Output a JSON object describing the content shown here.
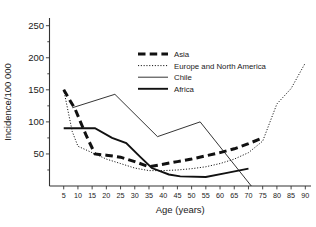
{
  "chart_data": {
    "type": "line",
    "title": "",
    "xlabel": "Age (years)",
    "ylabel": "Incidence/100 000",
    "xlim": [
      0,
      92
    ],
    "ylim": [
      0,
      262
    ],
    "grid": false,
    "legend_position": "upper-center",
    "xticks": [
      5,
      10,
      15,
      20,
      25,
      30,
      35,
      40,
      45,
      50,
      55,
      60,
      65,
      70,
      75,
      80,
      85,
      90
    ],
    "xtick_labels": [
      "5",
      "10",
      "15",
      "20",
      "25",
      "30",
      "35",
      "40",
      "45",
      "50",
      "55",
      "60",
      "65",
      "70",
      "75",
      "80",
      "85",
      "90"
    ],
    "yticks": [
      50,
      100,
      150,
      200,
      250
    ],
    "ytick_labels": [
      "50",
      "100",
      "150",
      "200",
      "250"
    ],
    "yminor": [
      25,
      75,
      125,
      175,
      225
    ],
    "series": [
      {
        "name": "Asia",
        "style": "thick-dashed",
        "color": "#111111",
        "x": [
          5,
          9,
          13,
          16,
          20,
          25,
          30,
          35,
          40,
          45,
          50,
          55,
          60,
          65,
          70,
          75
        ],
        "y": [
          150,
          120,
          78,
          50,
          48,
          45,
          38,
          30,
          34,
          38,
          42,
          47,
          52,
          58,
          66,
          75
        ]
      },
      {
        "name": "Europe and North America",
        "style": "dotted",
        "color": "#444444",
        "x": [
          5,
          8,
          10,
          15,
          20,
          25,
          30,
          35,
          40,
          45,
          50,
          55,
          60,
          65,
          70,
          75,
          80,
          85,
          90
        ],
        "y": [
          150,
          85,
          62,
          52,
          42,
          35,
          28,
          24,
          24,
          25,
          27,
          30,
          35,
          42,
          52,
          70,
          128,
          152,
          192
        ]
      },
      {
        "name": "Chile",
        "style": "thin-solid",
        "color": "#555555",
        "x": [
          8,
          23,
          38,
          53,
          71
        ],
        "y": [
          122,
          143,
          77,
          100,
          0
        ]
      },
      {
        "name": "Africa",
        "style": "medium-solid",
        "color": "#111111",
        "x": [
          5,
          16,
          22,
          27,
          32,
          36,
          42,
          46,
          55,
          62,
          70
        ],
        "y": [
          90,
          90,
          75,
          67,
          45,
          28,
          18,
          15,
          14,
          20,
          27
        ]
      }
    ],
    "legend": [
      {
        "label": "Asia",
        "style": "thick-dashed"
      },
      {
        "label": "Europe and North America",
        "style": "dotted"
      },
      {
        "label": "Chile",
        "style": "thin-solid"
      },
      {
        "label": "Africa",
        "style": "medium-solid"
      }
    ]
  }
}
